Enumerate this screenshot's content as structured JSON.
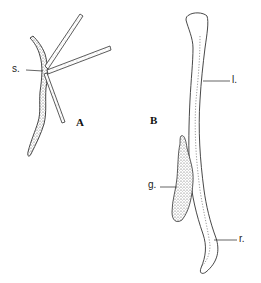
{
  "figure": {
    "panels": [
      {
        "id": "A",
        "label": "A",
        "annotations": [
          {
            "key": "s",
            "text": "s."
          }
        ]
      },
      {
        "id": "B",
        "label": "B",
        "annotations": [
          {
            "key": "l",
            "text": "l."
          },
          {
            "key": "g",
            "text": "g."
          },
          {
            "key": "r",
            "text": "r."
          }
        ]
      }
    ],
    "colors": {
      "ink": "#222222",
      "stipple": "#555555",
      "background": "#ffffff"
    }
  }
}
